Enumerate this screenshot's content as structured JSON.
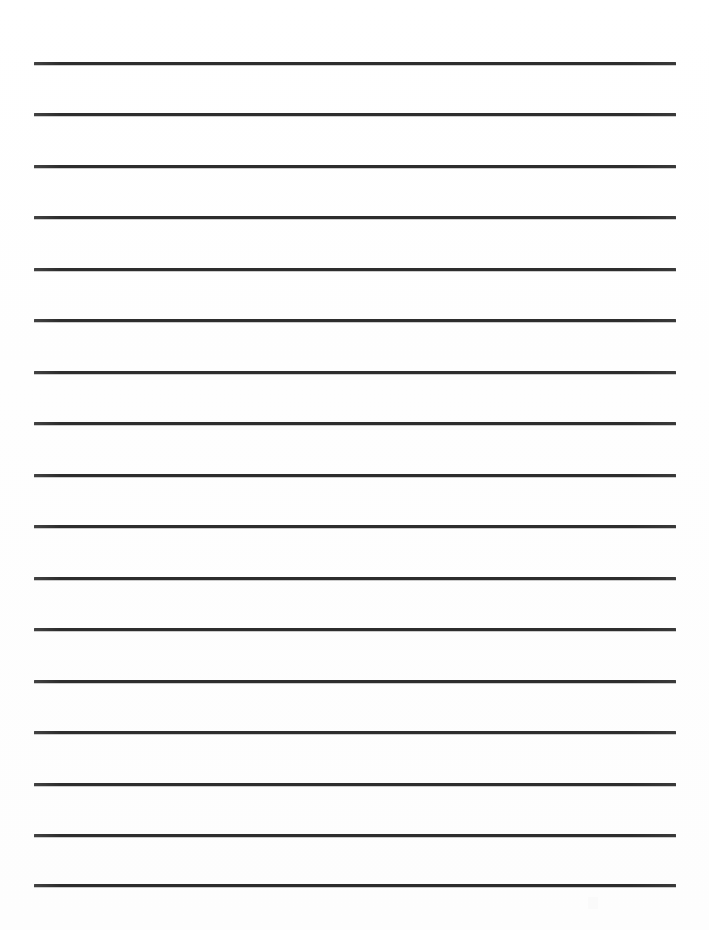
{
  "page": {
    "kind": "lined-writing-paper",
    "width": 709,
    "height": 930,
    "background_color": "#ffffff",
    "visible_text": ""
  },
  "rules": {
    "count": 17,
    "color": "#2d2d2d",
    "thickness_px": 3,
    "left_px": 34,
    "right_px": 676,
    "length_px": 642,
    "first_line_y_px": 62,
    "last_line_y_px": 884,
    "spacing_px": 51.4,
    "lines": [
      {
        "index": 1,
        "y": 62,
        "label": "rule-line-1"
      },
      {
        "index": 2,
        "y": 113,
        "label": "rule-line-2"
      },
      {
        "index": 3,
        "y": 165,
        "label": "rule-line-3"
      },
      {
        "index": 4,
        "y": 216,
        "label": "rule-line-4"
      },
      {
        "index": 5,
        "y": 268,
        "label": "rule-line-5"
      },
      {
        "index": 6,
        "y": 319,
        "label": "rule-line-6"
      },
      {
        "index": 7,
        "y": 371,
        "label": "rule-line-7"
      },
      {
        "index": 8,
        "y": 422,
        "label": "rule-line-8"
      },
      {
        "index": 9,
        "y": 474,
        "label": "rule-line-9"
      },
      {
        "index": 10,
        "y": 525,
        "label": "rule-line-10"
      },
      {
        "index": 11,
        "y": 577,
        "label": "rule-line-11"
      },
      {
        "index": 12,
        "y": 628,
        "label": "rule-line-12"
      },
      {
        "index": 13,
        "y": 680,
        "label": "rule-line-13"
      },
      {
        "index": 14,
        "y": 731,
        "label": "rule-line-14"
      },
      {
        "index": 15,
        "y": 783,
        "label": "rule-line-15"
      },
      {
        "index": 16,
        "y": 834,
        "label": "rule-line-16"
      },
      {
        "index": 17,
        "y": 884,
        "label": "rule-line-17"
      }
    ]
  },
  "artifact": {
    "name": "scan-artifact",
    "x": 588,
    "y": 897
  }
}
